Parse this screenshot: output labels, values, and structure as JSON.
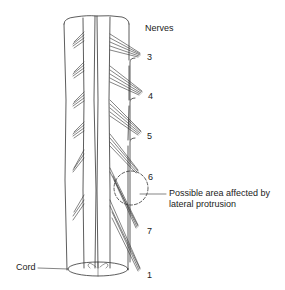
{
  "diagram": {
    "title_label": "Nerves",
    "nerve_numbers": [
      "3",
      "4",
      "5",
      "6",
      "7",
      "1"
    ],
    "annotation": {
      "line1": "Possible area affected by",
      "line2": "lateral protrusion"
    },
    "cord_label": "Cord",
    "colors": {
      "line": "#333333",
      "background": "#ffffff",
      "text": "#222222"
    }
  }
}
